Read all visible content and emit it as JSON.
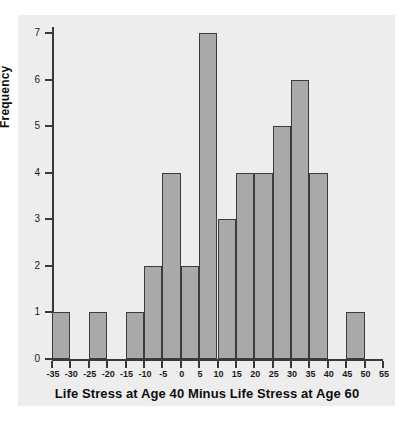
{
  "chart_data": {
    "type": "bar",
    "title": "",
    "xlabel": "Life Stress at Age 40 Minus Life Stress at Age 60",
    "ylabel": "Frequency",
    "xlim": [
      -35,
      55
    ],
    "ylim": [
      0,
      7
    ],
    "bin_width": 5,
    "grid": false,
    "legend": null,
    "xticks": [
      "-35",
      "-30",
      "-25",
      "-20",
      "-15",
      "-10",
      "-5",
      "0",
      "5",
      "10",
      "15",
      "20",
      "25",
      "30",
      "35",
      "40",
      "45",
      "50",
      "55"
    ],
    "yticks": [
      "0",
      "1",
      "2",
      "3",
      "4",
      "5",
      "6",
      "7"
    ],
    "bin_starts": [
      -35,
      -30,
      -25,
      -20,
      -15,
      -10,
      -5,
      0,
      5,
      10,
      15,
      20,
      25,
      30,
      35,
      40,
      45,
      50
    ],
    "categories": [
      "-35 to -30",
      "-30 to -25",
      "-25 to -20",
      "-20 to -15",
      "-15 to -10",
      "-10 to -5",
      "-5 to 0",
      "0 to 5",
      "5 to 10",
      "10 to 15",
      "15 to 20",
      "20 to 25",
      "25 to 30",
      "30 to 35",
      "35 to 40",
      "40 to 45",
      "45 to 50",
      "50 to 55"
    ],
    "values": [
      1,
      0,
      1,
      0,
      1,
      2,
      4,
      2,
      7,
      3,
      4,
      4,
      5,
      6,
      4,
      0,
      1,
      0
    ],
    "colors": {
      "bar_fill": "#a9a9a9",
      "bar_edge": "#3c3c3c",
      "panel_background": "#ededed",
      "figure_background": "#ffffff",
      "axis": "#3a3a3a",
      "text": "#0d0d0d"
    }
  }
}
